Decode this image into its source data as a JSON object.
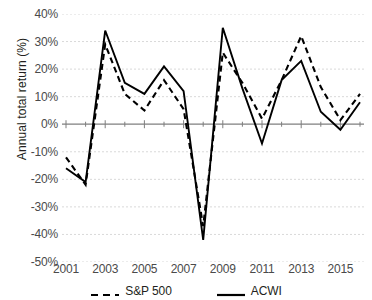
{
  "title": "",
  "axes": {
    "y_title": "Annual total return (%)",
    "y_ticks": [
      "40%",
      "30%",
      "20%",
      "10%",
      "0%",
      "-10%",
      "-20%",
      "-30%",
      "-40%",
      "-50%"
    ],
    "x_ticks": [
      "2001",
      "2003",
      "2005",
      "2007",
      "2009",
      "2011",
      "2013",
      "2015"
    ]
  },
  "legend": {
    "items": [
      {
        "label": "S&P 500",
        "style": "dashed",
        "color": "#000000"
      },
      {
        "label": "ACWI",
        "style": "solid",
        "color": "#000000"
      }
    ]
  },
  "colors": {
    "line": "#000000",
    "gridline": "#d9d9d9",
    "axis": "#7f7f7f",
    "text": "#231f20"
  },
  "chart_data": {
    "type": "line",
    "title": "",
    "xlabel": "",
    "ylabel": "Annual total return (%)",
    "ylim": [
      -50,
      40
    ],
    "ytick_values": [
      40,
      30,
      20,
      10,
      0,
      -10,
      -20,
      -30,
      -40,
      -50
    ],
    "grid": true,
    "legend_position": "bottom",
    "x": [
      2001,
      2002,
      2003,
      2004,
      2005,
      2006,
      2007,
      2008,
      2009,
      2010,
      2011,
      2012,
      2013,
      2014,
      2015,
      2016
    ],
    "xtick_labels": [
      "2001",
      "2003",
      "2005",
      "2007",
      "2009",
      "2011",
      "2013",
      "2015"
    ],
    "series": [
      {
        "name": "S&P 500",
        "style": "dashed",
        "values": [
          -12,
          -22,
          29,
          11,
          5,
          16,
          5.5,
          -37,
          26,
          15,
          2,
          16,
          32,
          13.5,
          1.5,
          11
        ]
      },
      {
        "name": "ACWI",
        "style": "solid",
        "values": [
          -16,
          -21,
          34,
          15,
          11,
          21,
          12,
          -42,
          35,
          13,
          -7,
          16,
          23,
          4.5,
          -2,
          8
        ]
      }
    ]
  }
}
